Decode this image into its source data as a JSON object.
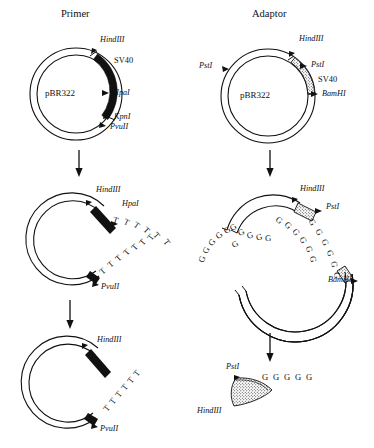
{
  "figure": {
    "background": "#ffffff",
    "ink": "#111111",
    "columns": [
      {
        "id": "primer",
        "title": "Primer"
      },
      {
        "id": "adaptor",
        "title": "Adaptor"
      }
    ]
  },
  "plasmid_name": "pBR322",
  "insert_label": "SV40",
  "enzymes": {
    "hindiii": "HindIII",
    "hpai": "HpaI",
    "kpni": "KpnI",
    "pvuii": "PvuII",
    "psti": "PstI",
    "bamhi": "BamHI"
  },
  "panels": {
    "primer_top": {
      "name": "pBR322 primer plasmid map",
      "plasmid": "pBR322",
      "insert": "SV40",
      "sites": [
        "HindIII",
        "HpaI",
        "KpnI",
        "PvuII"
      ],
      "insert_style": "solid-black-arc"
    },
    "adaptor_top": {
      "name": "pBR322 adaptor plasmid map",
      "plasmid": "pBR322",
      "insert": "SV40",
      "sites": [
        "PstI",
        "HindIII",
        "PstI",
        "BamHI"
      ],
      "insert_style": "stippled-arc"
    },
    "primer_mid": {
      "name": "primer plasmid with dT tails",
      "sites": [
        "HindIII",
        "HpaI",
        "PvuII"
      ],
      "tails": [
        {
          "base": "T",
          "count": 6
        },
        {
          "base": "T",
          "count": 7
        }
      ]
    },
    "adaptor_mid": {
      "name": "adaptor plasmid with dG tails",
      "sites": [
        "HindIII",
        "PstI",
        "BamHI"
      ],
      "tails": [
        {
          "base": "G",
          "count": 6
        },
        {
          "base": "G",
          "count": 6
        },
        {
          "base": "G",
          "count": 5
        },
        {
          "base": "G",
          "count": 6
        }
      ]
    },
    "primer_bottom": {
      "name": "primer plasmid single dT tail",
      "sites": [
        "HindIII",
        "PvuII"
      ],
      "tails": [
        {
          "base": "T",
          "count": 6
        }
      ]
    },
    "adaptor_bottom": {
      "name": "excised adaptor fragment",
      "sites": [
        "PstI",
        "HindIII"
      ],
      "tails": [
        {
          "base": "G",
          "count": 5
        }
      ],
      "fragment_style": "stippled-arc"
    }
  },
  "flow_arrows": [
    {
      "name": "primer-step-1-arrow",
      "direction": "down"
    },
    {
      "name": "primer-step-2-arrow",
      "direction": "down"
    },
    {
      "name": "adaptor-step-1-arrow",
      "direction": "down"
    },
    {
      "name": "adaptor-step-2-arrow",
      "direction": "down"
    }
  ],
  "tail_sequences": {
    "t6": "T T T T T T",
    "t7": "T T T T T T T",
    "g5": "G G G G G",
    "g6": "G G G G G G"
  }
}
